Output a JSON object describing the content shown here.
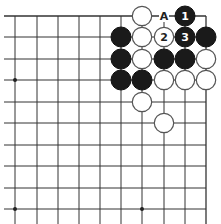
{
  "diagram": {
    "type": "go-board-fragment",
    "grid": {
      "columns_x": [
        15,
        37,
        58,
        79,
        100,
        121,
        142,
        164,
        185,
        206
      ],
      "rows_y": [
        16,
        37,
        59,
        80,
        102,
        123,
        145,
        166,
        188,
        209
      ],
      "top_edge": true,
      "right_edge": true,
      "line_color": "#333333"
    },
    "star_points": [
      {
        "col": 0,
        "row": 3
      },
      {
        "col": 0,
        "row": 9
      },
      {
        "col": 6,
        "row": 9
      }
    ],
    "stones": [
      {
        "col": 6,
        "row": 0,
        "color": "white",
        "label": ""
      },
      {
        "col": 8,
        "row": 0,
        "color": "black",
        "label": "1"
      },
      {
        "col": 5,
        "row": 1,
        "color": "black",
        "label": ""
      },
      {
        "col": 6,
        "row": 1,
        "color": "white",
        "label": ""
      },
      {
        "col": 7,
        "row": 1,
        "color": "white",
        "label": "2"
      },
      {
        "col": 8,
        "row": 1,
        "color": "black",
        "label": "3"
      },
      {
        "col": 9,
        "row": 1,
        "color": "black",
        "label": ""
      },
      {
        "col": 5,
        "row": 2,
        "color": "black",
        "label": ""
      },
      {
        "col": 6,
        "row": 2,
        "color": "white",
        "label": ""
      },
      {
        "col": 7,
        "row": 2,
        "color": "black",
        "label": ""
      },
      {
        "col": 8,
        "row": 2,
        "color": "black",
        "label": ""
      },
      {
        "col": 9,
        "row": 2,
        "color": "white",
        "label": ""
      },
      {
        "col": 5,
        "row": 3,
        "color": "black",
        "label": ""
      },
      {
        "col": 6,
        "row": 3,
        "color": "black",
        "label": ""
      },
      {
        "col": 7,
        "row": 3,
        "color": "white",
        "label": ""
      },
      {
        "col": 8,
        "row": 3,
        "color": "white",
        "label": ""
      },
      {
        "col": 9,
        "row": 3,
        "color": "white",
        "label": ""
      },
      {
        "col": 6,
        "row": 4,
        "color": "white",
        "label": ""
      },
      {
        "col": 7,
        "row": 5,
        "color": "white",
        "label": ""
      }
    ],
    "markers": [
      {
        "col": 7,
        "row": 0,
        "label": "A"
      }
    ]
  }
}
